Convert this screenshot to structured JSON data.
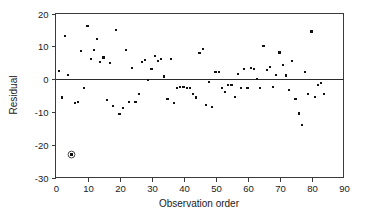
{
  "chart_data": {
    "type": "scatter",
    "title": "",
    "xlabel": "Observation order",
    "ylabel": "Residual",
    "xlim": [
      0,
      90
    ],
    "ylim": [
      -30,
      20
    ],
    "xticks": [
      0,
      10,
      20,
      30,
      40,
      50,
      60,
      70,
      80,
      90
    ],
    "yticks": [
      20,
      10,
      0,
      -10,
      -20,
      -30
    ],
    "xtick_labels": [
      "0",
      "10",
      "20",
      "30",
      "40",
      "50",
      "60",
      "70",
      "80",
      "90"
    ],
    "ytick_labels": [
      "20",
      "10",
      "0",
      "-10",
      "-20",
      "-30"
    ],
    "grid": false,
    "legend": null,
    "reference_lines": [
      {
        "axis": "y",
        "value": 0,
        "style": "solid",
        "color": "#2b2b2b"
      }
    ],
    "marker": {
      "shape": "square",
      "size": 2.1,
      "color": "#111111"
    },
    "annotations": [
      {
        "kind": "circled-outlier",
        "x": 5,
        "y": -23,
        "note": "circled point marking an outlying residual"
      }
    ],
    "series": [
      {
        "name": "residuals",
        "x": [
          1,
          2,
          3,
          4,
          5,
          6,
          7,
          8,
          9,
          10,
          11,
          12,
          13,
          14,
          15,
          16,
          17,
          18,
          19,
          20,
          21,
          22,
          23,
          24,
          25,
          26,
          27,
          28,
          29,
          30,
          31,
          32,
          33,
          34,
          35,
          36,
          37,
          38,
          39,
          40,
          41,
          42,
          43,
          44,
          45,
          46,
          47,
          48,
          49,
          50,
          51,
          52,
          53,
          54,
          55,
          56,
          57,
          58,
          59,
          60,
          61,
          62,
          63,
          64,
          65,
          66,
          67,
          68,
          69,
          70,
          71,
          72,
          73,
          74,
          75,
          76,
          77,
          78,
          79,
          80,
          81,
          82,
          83,
          84
        ],
        "y": [
          2.4,
          -5.6,
          13.1,
          1.2,
          -23.0,
          -7.2,
          -6.9,
          8.5,
          -2.7,
          16.3,
          6.1,
          9.0,
          12.2,
          5.3,
          6.6,
          -6.4,
          5.0,
          -8.1,
          15.0,
          -10.6,
          -8.9,
          9.0,
          -7.0,
          3.3,
          -6.9,
          -4.6,
          5.3,
          5.7,
          -0.3,
          3.1,
          7.0,
          5.6,
          6.1,
          0.8,
          -6.0,
          6.2,
          -7.3,
          -2.8,
          -2.5,
          -2.3,
          -2.7,
          -2.6,
          -4.6,
          -5.6,
          8.0,
          9.3,
          -8.0,
          -0.8,
          -8.5,
          2.2,
          2.3,
          -2.6,
          -4.0,
          -1.8,
          -1.7,
          -5.4,
          1.6,
          -2.7,
          3.0,
          -2.6,
          3.5,
          3.2,
          0.0,
          -2.8,
          10.1,
          2.7,
          3.6,
          -2.5,
          1.2,
          8.1,
          4.3,
          1.1,
          -3.3,
          5.5,
          -6.0,
          -10.5,
          -14.0,
          2.2,
          -4.6,
          14.5,
          -5.5,
          -1.8,
          -1.2,
          -4.5
        ]
      }
    ]
  },
  "axis": {
    "ylabel": "Residual",
    "xlabel": "Observation order"
  }
}
